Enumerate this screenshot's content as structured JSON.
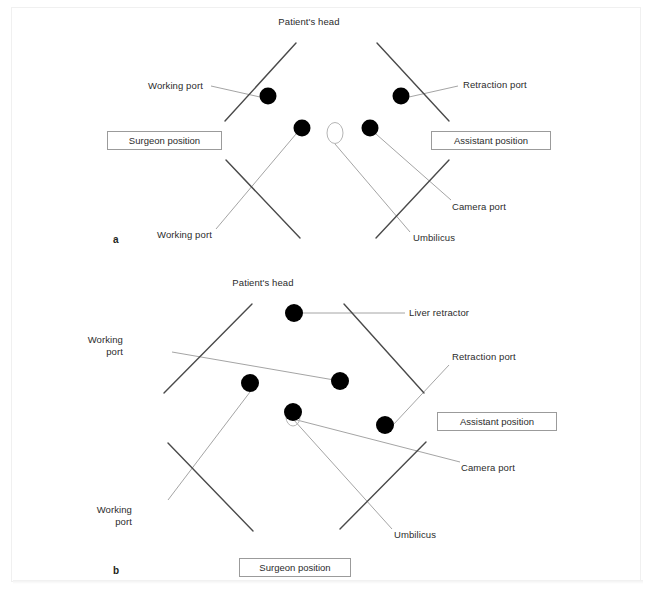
{
  "figure": {
    "kind": "surgical-port-placement-diagram",
    "panels": [
      {
        "id": "a",
        "letter": "a",
        "letter_pos": {
          "x": 113,
          "y": 234
        },
        "head_label": {
          "text": "Patient's head",
          "x": 309,
          "y": 16
        },
        "body_lines": [
          {
            "name": "body-line-upper-left",
            "x1": 225,
            "y1": 121,
            "x2": 296,
            "y2": 43,
            "color": "#4a4a4a",
            "width": 1.4
          },
          {
            "name": "body-line-upper-right",
            "x1": 377,
            "y1": 43,
            "x2": 449,
            "y2": 121,
            "color": "#4a4a4a",
            "width": 1.4
          },
          {
            "name": "body-line-lower-left",
            "x1": 226,
            "y1": 160,
            "x2": 300,
            "y2": 238,
            "color": "#4a4a4a",
            "width": 1.4
          },
          {
            "name": "body-line-lower-right",
            "x1": 449,
            "y1": 160,
            "x2": 376,
            "y2": 238,
            "color": "#4a4a4a",
            "width": 1.4
          }
        ],
        "ports": [
          {
            "name": "port-working-upper-left",
            "x": 268,
            "y": 96,
            "r": 8.5,
            "color": "#000000"
          },
          {
            "name": "port-retraction-upper-right",
            "x": 401,
            "y": 96,
            "r": 8.5,
            "color": "#000000"
          },
          {
            "name": "port-working-lower-left",
            "x": 302,
            "y": 128,
            "r": 8.5,
            "color": "#000000"
          },
          {
            "name": "port-camera-lower-right",
            "x": 370,
            "y": 128,
            "r": 8.5,
            "color": "#000000"
          }
        ],
        "umbilicus": {
          "name": "umbilicus-marker",
          "cx": 335,
          "cy": 133,
          "rx": 8,
          "ry": 10.5,
          "stroke": "#b5b5b5"
        },
        "leaders": [
          {
            "name": "leader-working-port-upper",
            "x1": 211,
            "y1": 86,
            "x2": 260,
            "y2": 97
          },
          {
            "name": "leader-retraction-port",
            "x1": 458,
            "y1": 86,
            "x2": 409,
            "y2": 97
          },
          {
            "name": "leader-working-port-lower",
            "x1": 216,
            "y1": 229,
            "x2": 296,
            "y2": 134
          },
          {
            "name": "leader-umbilicus",
            "x1": 410,
            "y1": 232,
            "x2": 335,
            "y2": 144
          },
          {
            "name": "leader-camera-port",
            "x1": 451,
            "y1": 200,
            "x2": 376,
            "y2": 134
          }
        ],
        "annotations": [
          {
            "name": "label-working-port-upper",
            "text": "Working port",
            "x": 148,
            "y": 80,
            "align": "left"
          },
          {
            "name": "label-retraction-port",
            "text": "Retraction port",
            "x": 463,
            "y": 79,
            "align": "left"
          },
          {
            "name": "label-working-port-lower",
            "text": "Working port",
            "x": 157,
            "y": 229,
            "align": "left"
          },
          {
            "name": "label-umbilicus",
            "text": "Umbilicus",
            "x": 413,
            "y": 232,
            "align": "left"
          },
          {
            "name": "label-camera-port",
            "text": "Camera port",
            "x": 452,
            "y": 201,
            "align": "left"
          }
        ],
        "position_boxes": [
          {
            "name": "surgeon-position-box",
            "text": "Surgeon position",
            "x": 107,
            "y": 131,
            "w": 115,
            "h": 19
          },
          {
            "name": "assistant-position-box",
            "text": "Assistant position",
            "x": 431,
            "y": 131,
            "w": 120,
            "h": 19
          }
        ]
      },
      {
        "id": "b",
        "letter": "b",
        "letter_pos": {
          "x": 113,
          "y": 565
        },
        "head_label": {
          "text": "Patient's head",
          "x": 263,
          "y": 277
        },
        "body_lines": [
          {
            "name": "body-line-upper-left",
            "x1": 164,
            "y1": 393,
            "x2": 252,
            "y2": 304,
            "color": "#4a4a4a",
            "width": 1.4
          },
          {
            "name": "body-line-upper-right",
            "x1": 344,
            "y1": 304,
            "x2": 424,
            "y2": 393,
            "color": "#4a4a4a",
            "width": 1.4
          },
          {
            "name": "body-line-lower-left",
            "x1": 168,
            "y1": 443,
            "x2": 253,
            "y2": 531,
            "color": "#4a4a4a",
            "width": 1.4
          },
          {
            "name": "body-line-lower-right",
            "x1": 426,
            "y1": 442,
            "x2": 340,
            "y2": 529,
            "color": "#4a4a4a",
            "width": 1.4
          }
        ],
        "ports": [
          {
            "name": "port-liver-retractor",
            "x": 294,
            "y": 313,
            "r": 9,
            "color": "#000000"
          },
          {
            "name": "port-working-left",
            "x": 250,
            "y": 383,
            "r": 9,
            "color": "#000000"
          },
          {
            "name": "port-working-mid",
            "x": 340,
            "y": 381,
            "r": 9,
            "color": "#000000"
          },
          {
            "name": "port-camera-center",
            "x": 293,
            "y": 412,
            "r": 9,
            "color": "#000000"
          },
          {
            "name": "port-retraction-right",
            "x": 385,
            "y": 425,
            "r": 9,
            "color": "#000000"
          }
        ],
        "umbilicus": {
          "name": "umbilicus-marker",
          "cx": 293,
          "cy": 417,
          "rx": 7,
          "ry": 9,
          "stroke": "#b5b5b5"
        },
        "leaders": [
          {
            "name": "leader-liver-retractor",
            "x1": 405,
            "y1": 313,
            "x2": 303,
            "y2": 313
          },
          {
            "name": "leader-working-port-upper",
            "x1": 172,
            "y1": 352,
            "x2": 340,
            "y2": 381
          },
          {
            "name": "leader-retraction-port",
            "x1": 449,
            "y1": 365,
            "x2": 393,
            "y2": 425
          },
          {
            "name": "leader-working-port-lower",
            "x1": 168,
            "y1": 500,
            "x2": 250,
            "y2": 392
          },
          {
            "name": "leader-umbilicus",
            "x1": 392,
            "y1": 529,
            "x2": 293,
            "y2": 419
          },
          {
            "name": "leader-camera-port",
            "x1": 460,
            "y1": 462,
            "x2": 293,
            "y2": 419
          }
        ],
        "annotations": [
          {
            "name": "label-liver-retractor",
            "text": "Liver retractor",
            "x": 409,
            "y": 307,
            "align": "left"
          },
          {
            "name": "label-working-port-upper",
            "text": "Working\nport",
            "x": 123,
            "y": 334,
            "align": "right"
          },
          {
            "name": "label-retraction-port",
            "text": "Retraction port",
            "x": 452,
            "y": 351,
            "align": "left"
          },
          {
            "name": "label-working-port-lower",
            "text": "Working\nport",
            "x": 132,
            "y": 504,
            "align": "right"
          },
          {
            "name": "label-umbilicus",
            "text": "Umbilicus",
            "x": 394,
            "y": 529,
            "align": "left"
          },
          {
            "name": "label-camera-port",
            "text": "Camera port",
            "x": 461,
            "y": 462,
            "align": "left"
          }
        ],
        "position_boxes": [
          {
            "name": "assistant-position-box",
            "text": "Assistant position",
            "x": 437,
            "y": 412,
            "w": 120,
            "h": 19
          },
          {
            "name": "surgeon-position-box",
            "text": "Surgeon position",
            "x": 239,
            "y": 558,
            "w": 112,
            "h": 19
          }
        ]
      }
    ],
    "colors": {
      "port_fill": "#000000",
      "body_line": "#4a4a4a",
      "leader_line": "#9a9a9a",
      "box_border": "#9b9b9b",
      "text": "#2b2b2b",
      "frame_border": "#f0f0f0",
      "background": "#ffffff"
    }
  }
}
